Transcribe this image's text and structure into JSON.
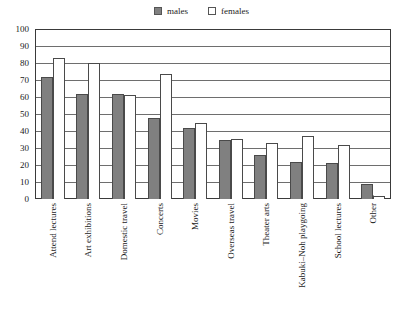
{
  "legend": {
    "position": "top-center",
    "entries": [
      {
        "label": "males",
        "swatch": "filled-gray-square",
        "color": "#808080"
      },
      {
        "label": "females",
        "swatch": "outlined-white-square",
        "color": "#ffffff"
      }
    ]
  },
  "axis": {
    "y_ticks": [
      "0",
      "10",
      "20",
      "30",
      "40",
      "50",
      "60",
      "70",
      "80",
      "90",
      "100"
    ]
  },
  "chart_data": {
    "type": "bar",
    "title": "",
    "xlabel": "",
    "ylabel": "",
    "ylim": [
      0,
      100
    ],
    "ytick_step": 10,
    "grid": true,
    "legend_position": "top-center",
    "categories": [
      "Attend lectures",
      "Art exhibitions",
      "Domestic travel",
      "Concerts",
      "Movies",
      "Overseas travel",
      "Theater arts",
      "Kabuki–Noh playgoing",
      "School lectures",
      "Other"
    ],
    "series": [
      {
        "name": "males",
        "color": "#808080",
        "values": [
          72,
          62,
          62,
          47.5,
          41.5,
          35,
          26,
          22,
          21,
          9
        ]
      },
      {
        "name": "females",
        "color": "#ffffff",
        "values": [
          83,
          80,
          61,
          73.5,
          45,
          35.5,
          33,
          37,
          31.5,
          2
        ]
      }
    ]
  }
}
